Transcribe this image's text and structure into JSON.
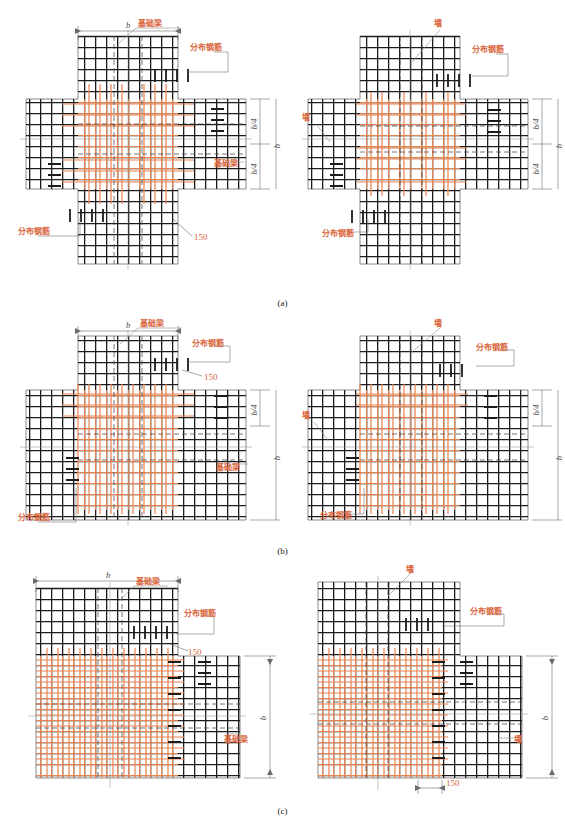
{
  "figure": {
    "accent_orange": "#e8824f",
    "rebar_black": "#1c1c1c",
    "dim_gray": "#6b6b6b"
  },
  "labels": {
    "foundation_beam": "基础梁",
    "wall": "墙",
    "distribution_rebar": "分布钢筋",
    "dim_150": "150",
    "dim_b": "b",
    "dim_b_quarter": "b/4"
  },
  "panels": [
    {
      "key": "a",
      "caption": "(a)",
      "junction": "cross",
      "left": {
        "member_label": "基础梁",
        "annotations": [
          "基础梁",
          "分布钢筋",
          "基础梁",
          "分布钢筋",
          "150"
        ],
        "dims": {
          "top": "b",
          "right_total": "b",
          "right_upper": "b/4",
          "right_lower": "b/4"
        }
      },
      "right": {
        "member_label": "墙",
        "annotations": [
          "墙",
          "分布钢筋",
          "墙",
          "分布钢筋"
        ],
        "dims": {
          "right_total": "b",
          "right_upper": "b/4",
          "right_lower": "b/4"
        }
      }
    },
    {
      "key": "b",
      "caption": "(b)",
      "junction": "tee",
      "left": {
        "member_label": "基础梁",
        "annotations": [
          "基础梁",
          "分布钢筋",
          "150",
          "基础梁",
          "分布钢筋"
        ],
        "dims": {
          "top": "b",
          "right_total": "b",
          "right_upper": "b/4"
        }
      },
      "right": {
        "member_label": "墙",
        "annotations": [
          "墙",
          "分布钢筋",
          "墙",
          "分布钢筋"
        ],
        "dims": {
          "right_total": "b",
          "right_upper": "b/4"
        }
      }
    },
    {
      "key": "c",
      "caption": "(c)",
      "junction": "corner",
      "left": {
        "member_label": "基础梁",
        "annotations": [
          "基础梁",
          "分布钢筋",
          "150",
          "基础梁"
        ],
        "dims": {
          "top": "b",
          "right_total": "b"
        }
      },
      "right": {
        "member_label": "墙",
        "annotations": [
          "墙",
          "分布钢筋",
          "墙",
          "150"
        ],
        "dims": {
          "right_total": "b"
        }
      }
    }
  ]
}
